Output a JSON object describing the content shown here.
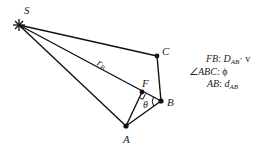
{
  "diagram": {
    "points": {
      "S": {
        "label": "S",
        "x": 19,
        "y": 25
      },
      "C": {
        "label": "C",
        "x": 157,
        "y": 56
      },
      "F": {
        "label": "F",
        "x": 142,
        "y": 92
      },
      "B": {
        "label": "B",
        "x": 161,
        "y": 101
      },
      "A": {
        "label": "A",
        "x": 126,
        "y": 126
      }
    },
    "edge_label": {
      "text": "r",
      "sub": "B"
    },
    "angle_label": "θ",
    "legend": [
      {
        "key": "FB",
        "sep": ":",
        "value": "D",
        "value_sub": "AB",
        "suffix": "· v"
      },
      {
        "key": "∠ABC",
        "sep": ":",
        "value": "ϕ",
        "value_sub": "",
        "suffix": ""
      },
      {
        "key": "AB",
        "sep": ":",
        "value": "d",
        "value_sub": "AB",
        "suffix": ""
      }
    ]
  }
}
